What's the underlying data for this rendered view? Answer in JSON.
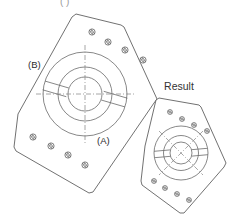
{
  "canvas": {
    "width": 242,
    "height": 220,
    "background": "#ffffff"
  },
  "theme": {
    "outline_color": "#575757",
    "feature_color": "#6a6a6a",
    "centerline_color": "#8a8a8a",
    "hole_color": "#5f5f5f",
    "text_color": "#2b2b2b",
    "clipped_text_color": "#9a9a9a"
  },
  "figure": {
    "title_clipped": "(   )",
    "labels": {
      "label_a": "(A)",
      "label_b": "(B)",
      "result": "Result"
    }
  },
  "parts": {
    "source_plate": {
      "name": "source-plate",
      "outline_points": "76,14 121,25 124,27 157,99 154,103 93,192 89,193 16,151 14,147 18,114 72,17",
      "hub": {
        "center_x": 85,
        "center_y": 94,
        "outer_radius": 42,
        "middle_radius": 27,
        "inner_radius": 17
      },
      "centerlines": [
        {
          "x1": 36,
          "y1": 94,
          "x2": 134,
          "y2": 94
        },
        {
          "x1": 85,
          "y1": 45,
          "x2": 85,
          "y2": 143
        }
      ],
      "slots": [
        {
          "angle_deg": 196,
          "inner": 17,
          "outer": 42,
          "half_width": 4.5
        },
        {
          "angle_deg": 16,
          "inner": 17,
          "outer": 42,
          "half_width": 4.5
        }
      ],
      "bolt_holes_top": [
        {
          "cx": 92,
          "cy": 32
        },
        {
          "cx": 108,
          "cy": 42
        },
        {
          "cx": 125,
          "cy": 50
        },
        {
          "cx": 143,
          "cy": 60
        }
      ],
      "bolt_holes_bottom": [
        {
          "cx": 33,
          "cy": 137
        },
        {
          "cx": 51,
          "cy": 146
        },
        {
          "cx": 68,
          "cy": 155
        },
        {
          "cx": 85,
          "cy": 165
        }
      ],
      "hole_radius": 3.1
    },
    "result_plate": {
      "name": "result-plate",
      "outline_points": "159,98 199,105 201,107 226,163 224,167 184,213 180,213 142,185 141,181 145,146 156,100",
      "hub": {
        "center_x": 181,
        "center_y": 153,
        "outer_radius": 27,
        "middle_radius": 17.5,
        "inner_radius": 11
      },
      "centerlines": [
        {
          "x1": 159,
          "y1": 131,
          "x2": 203,
          "y2": 175
        },
        {
          "x1": 203,
          "y1": 131,
          "x2": 159,
          "y2": 175
        }
      ],
      "slots": [
        {
          "angle_deg": 185,
          "inner": 11,
          "outer": 27,
          "half_width": 3.2
        },
        {
          "angle_deg": 5,
          "inner": 11,
          "outer": 27,
          "half_width": 3.2
        }
      ],
      "bolt_holes_top": [
        {
          "cx": 170,
          "cy": 112
        },
        {
          "cx": 182,
          "cy": 119
        },
        {
          "cx": 194,
          "cy": 125
        },
        {
          "cx": 207,
          "cy": 131
        }
      ],
      "bolt_holes_bottom": [
        {
          "cx": 154,
          "cy": 181
        },
        {
          "cx": 165,
          "cy": 188
        },
        {
          "cx": 177,
          "cy": 194
        },
        {
          "cx": 189,
          "cy": 200
        }
      ],
      "hole_radius": 2.4
    }
  },
  "label_positions": {
    "label_b": {
      "x": 28,
      "y": 68
    },
    "label_a": {
      "x": 97,
      "y": 144
    },
    "result": {
      "x": 179,
      "y": 90
    },
    "title_clipped": {
      "x": 60,
      "y": 5
    }
  }
}
